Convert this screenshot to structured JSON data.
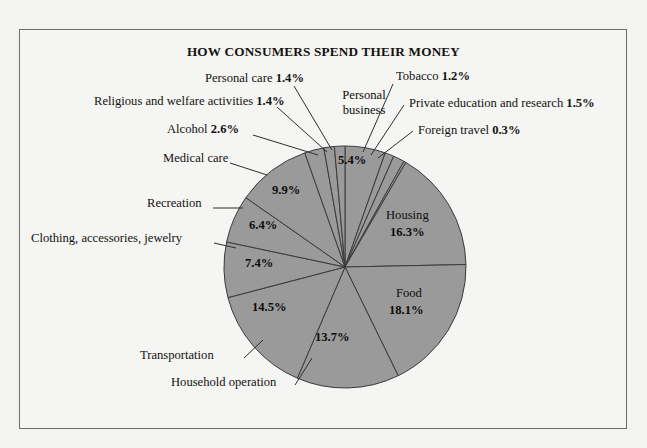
{
  "chart_data": {
    "type": "pie",
    "title": "HOW CONSUMERS SPEND THEIR MONEY",
    "xlabel": "",
    "ylabel": "",
    "legend_position": "none",
    "grid": false,
    "units": "percent",
    "start_angle_deg": 0,
    "direction": "clockwise",
    "categories": [
      "Personal business",
      "Tobacco",
      "Private education and research",
      "Foreign travel",
      "Housing",
      "Food",
      "Household operation",
      "Transportation",
      "Clothing, accessories, jewelry",
      "Recreation",
      "Medical care",
      "Alcohol",
      "Religious and welfare activities",
      "Personal care"
    ],
    "values": [
      5.4,
      1.2,
      1.5,
      0.3,
      16.3,
      18.1,
      13.7,
      14.5,
      7.4,
      6.4,
      9.9,
      2.6,
      1.4,
      1.4
    ],
    "value_labels": [
      "5.4%",
      "1.2%",
      "1.5%",
      "0.3%",
      "16.3%",
      "18.1%",
      "13.7%",
      "14.5%",
      "7.4%",
      "6.4%",
      "9.9%",
      "2.6%",
      "1.4%",
      "1.4%"
    ],
    "slice_fill": "#9a9a9a",
    "slice_stroke": "#3b3b3b",
    "background": "#f5f5f3"
  },
  "title": "HOW CONSUMERS SPEND THEIR MONEY",
  "callouts": {
    "personal_care": {
      "name": "Personal care",
      "value": "1.4%"
    },
    "religious": {
      "name": "Religious and welfare activities",
      "value": "1.4%"
    },
    "alcohol": {
      "name": "Alcohol",
      "value": "2.6%"
    },
    "medical_care": {
      "name": "Medical care",
      "value": ""
    },
    "recreation": {
      "name": "Recreation",
      "value": ""
    },
    "clothing": {
      "name": "Clothing, accessories, jewelry",
      "value": ""
    },
    "transportation": {
      "name": "Transportation",
      "value": ""
    },
    "household_operation": {
      "name": "Household operation",
      "value": ""
    },
    "tobacco": {
      "name": "Tobacco",
      "value": "1.2%"
    },
    "private_education": {
      "name": "Private education and research",
      "value": "1.5%"
    },
    "foreign_travel": {
      "name": "Foreign travel",
      "value": "0.3%"
    }
  },
  "inside_labels": {
    "personal_business_line1": "Personal",
    "personal_business_line2": "business",
    "personal_business_value": "5.4%",
    "housing_name": "Housing",
    "housing_value": "16.3%",
    "food_name": "Food",
    "food_value": "18.1%",
    "household_value": "13.7%",
    "transportation_value": "14.5%",
    "clothing_value": "7.4%",
    "recreation_value": "6.4%",
    "medical_value": "9.9%"
  }
}
